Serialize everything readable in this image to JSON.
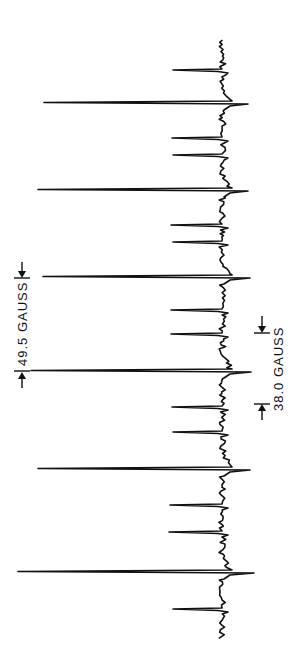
{
  "figure": {
    "type": "EPR spectrum (derivative trace, rotated 90°)",
    "ink_color": "#111111",
    "background": "#ffffff"
  },
  "annotations": {
    "left_label": "49.5 GAUSS",
    "right_label": "38.0 GAUSS"
  },
  "spectrum": {
    "baseline_x": 222,
    "large_peaks": [
      {
        "y": 103,
        "tip_x": 44,
        "overshoot_x": 248
      },
      {
        "y": 190,
        "tip_x": 38,
        "overshoot_x": 248
      },
      {
        "y": 277,
        "tip_x": 43,
        "overshoot_x": 250
      },
      {
        "y": 371,
        "tip_x": 31,
        "overshoot_x": 251
      },
      {
        "y": 469,
        "tip_x": 38,
        "overshoot_x": 250
      },
      {
        "y": 572,
        "tip_x": 18,
        "overshoot_x": 254
      }
    ],
    "small_peaks": [
      {
        "y": 70,
        "tip_x": 173
      },
      {
        "y": 138,
        "tip_x": 172
      },
      {
        "y": 155,
        "tip_x": 173
      },
      {
        "y": 225,
        "tip_x": 171
      },
      {
        "y": 242,
        "tip_x": 173
      },
      {
        "y": 310,
        "tip_x": 171
      },
      {
        "y": 334,
        "tip_x": 171
      },
      {
        "y": 407,
        "tip_x": 172
      },
      {
        "y": 432,
        "tip_x": 173
      },
      {
        "y": 505,
        "tip_x": 170
      },
      {
        "y": 532,
        "tip_x": 169
      },
      {
        "y": 609,
        "tip_x": 173
      }
    ]
  }
}
